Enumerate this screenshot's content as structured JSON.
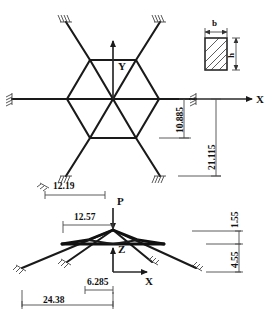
{
  "figure": {
    "line_color": "#1a1a1a",
    "dim_color": "#4a4a4a",
    "background": "#ffffff"
  },
  "plan_view": {
    "name": "plan-view",
    "axes": {
      "y_label": "Y",
      "x_label": "X"
    },
    "dimensions": [
      {
        "id": "d_10885",
        "value": "10.885",
        "orientation": "vertical"
      },
      {
        "id": "d_21115",
        "value": "21.115",
        "orientation": "vertical"
      },
      {
        "id": "d_1219",
        "value": "12.19",
        "orientation": "horizontal"
      }
    ]
  },
  "section_detail": {
    "name": "cross-section-detail",
    "width_label": "b",
    "height_label": "h"
  },
  "elevation_view": {
    "name": "elevation-view",
    "load_label": "P",
    "axes": {
      "z_label": "Z",
      "x_label": "X"
    },
    "dimensions": [
      {
        "id": "d_1257",
        "value": "12.57",
        "orientation": "horizontal"
      },
      {
        "id": "d_6285",
        "value": "6.285",
        "orientation": "horizontal"
      },
      {
        "id": "d_2438",
        "value": "24.38",
        "orientation": "horizontal"
      },
      {
        "id": "d_155",
        "value": "1.55",
        "orientation": "vertical"
      },
      {
        "id": "d_455",
        "value": "4.55",
        "orientation": "vertical"
      }
    ]
  }
}
